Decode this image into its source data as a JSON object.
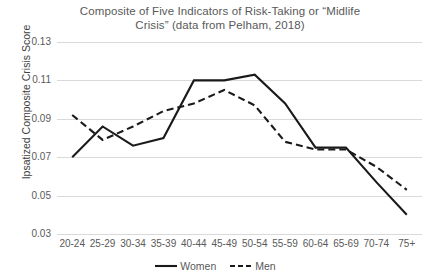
{
  "chart_data": {
    "type": "line",
    "title_line1": "Composite of Five Indicators of Risk-Taking or “Midlife",
    "title_line2": "Crisis” (data from Pelham, 2018)",
    "xlabel": "",
    "ylabel": "Ipsatized Composite Crisis Score",
    "categories": [
      "20-24",
      "25-29",
      "30-34",
      "35-39",
      "40-44",
      "45-49",
      "50-54",
      "55-59",
      "60-64",
      "65-69",
      "70-74",
      "75+"
    ],
    "ylim": [
      0.03,
      0.13
    ],
    "ytick_labels": [
      "0.13",
      "0.11",
      "0.09",
      "0.07",
      "0.05",
      "0.03"
    ],
    "yticks": [
      0.13,
      0.11,
      0.09,
      0.07,
      0.05,
      0.03
    ],
    "grid": true,
    "legend_position": "bottom",
    "series": [
      {
        "name": "Women",
        "style": "solid",
        "color": "#1a1a1a",
        "values": [
          0.07,
          0.086,
          0.076,
          0.08,
          0.11,
          0.11,
          0.113,
          0.098,
          0.075,
          0.075,
          0.057,
          0.04
        ]
      },
      {
        "name": "Men",
        "style": "dashed",
        "color": "#1a1a1a",
        "values": [
          0.092,
          0.079,
          0.086,
          0.094,
          0.098,
          0.105,
          0.097,
          0.078,
          0.074,
          0.074,
          0.065,
          0.053
        ]
      }
    ]
  },
  "colors": {
    "title_text": "#595959",
    "axis_text": "#595959",
    "gridline": "#d9d9d9",
    "series_line": "#1a1a1a",
    "background": "#ffffff"
  }
}
